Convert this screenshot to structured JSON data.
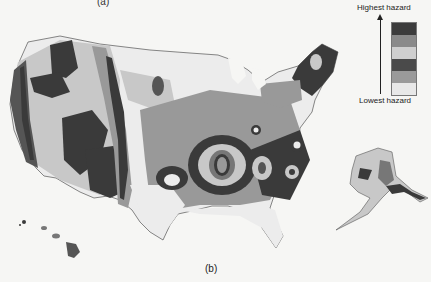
{
  "captions": {
    "top": "(a)",
    "bottom": "(b)"
  },
  "legend": {
    "high_label": "Highest hazard",
    "low_label": "Lowest hazard",
    "swatches": [
      {
        "level": 6,
        "color": "#3c3c3c"
      },
      {
        "level": 5,
        "color": "#8a8a8a"
      },
      {
        "level": 4,
        "color": "#cfcfcf"
      },
      {
        "level": 3,
        "color": "#4a4a4a"
      },
      {
        "level": 2,
        "color": "#9a9a9a"
      },
      {
        "level": 1,
        "color": "#e8e8e8"
      }
    ]
  },
  "map": {
    "subject": "Seismic hazard map of the United States",
    "regions": [
      "Contiguous US",
      "Alaska",
      "Hawaii"
    ],
    "colors": {
      "lowest": "#ececec",
      "low": "#c8c8c8",
      "mid": "#999999",
      "high": "#555555",
      "highest": "#3a3a3a",
      "border": "#555"
    }
  }
}
